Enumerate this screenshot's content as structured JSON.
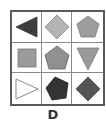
{
  "puzzle": {
    "option_label": "D",
    "colors": {
      "border": "#5a5a5a",
      "divider": "#8a8a8a",
      "dark": "#3a3a3a",
      "darkgray": "#555555",
      "gray": "#9a9a9a",
      "light": "#b5b5b5",
      "white": "#ffffff"
    },
    "cells": [
      {
        "row": 1,
        "col": 1,
        "shape": "triangle-left",
        "fill": "dark"
      },
      {
        "row": 1,
        "col": 2,
        "shape": "diamond",
        "fill": "light"
      },
      {
        "row": 1,
        "col": 3,
        "shape": "pentagon",
        "fill": "gray"
      },
      {
        "row": 2,
        "col": 1,
        "shape": "square",
        "fill": "gray"
      },
      {
        "row": 2,
        "col": 2,
        "shape": "pentagon",
        "fill": "gray"
      },
      {
        "row": 2,
        "col": 3,
        "shape": "triangle-down",
        "fill": "gray"
      },
      {
        "row": 3,
        "col": 1,
        "shape": "triangle-right",
        "fill": "white"
      },
      {
        "row": 3,
        "col": 2,
        "shape": "pentagon",
        "fill": "dark"
      },
      {
        "row": 3,
        "col": 3,
        "shape": "diamond",
        "fill": "darkgray"
      }
    ]
  }
}
